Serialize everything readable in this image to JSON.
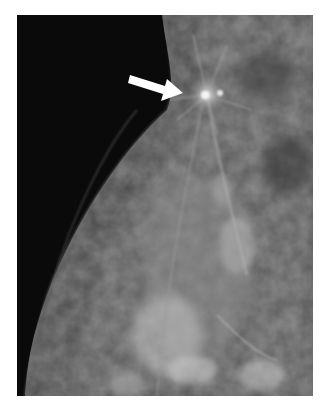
{
  "figure": {
    "type": "mammogram",
    "annotation": {
      "kind": "arrow",
      "color": "#ffffff",
      "points_to": "spiculated-mass"
    },
    "colors": {
      "background": "#0a0a0a",
      "tissue": "#6e6e6e",
      "bright": "#dcdcdc",
      "page": "#ffffff"
    }
  }
}
